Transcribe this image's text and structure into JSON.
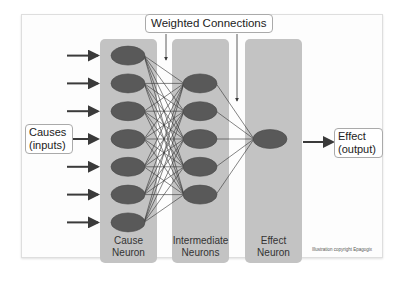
{
  "diagram": {
    "title_callout": "Weighted Connections",
    "inputs_label_line1": "Causes",
    "inputs_label_line2": "(inputs)",
    "output_label_line1": "Effect",
    "output_label_line2": "(output)",
    "columns": [
      {
        "label_line1": "Cause",
        "label_line2": "Neuron",
        "neuron_count": 7
      },
      {
        "label_line1": "Intermediate",
        "label_line2": "Neurons",
        "neuron_count": 5
      },
      {
        "label_line1": "Effect",
        "label_line2": "Neuron",
        "neuron_count": 1
      }
    ],
    "copyright": "Illustration copyright Epagogix",
    "colors": {
      "column_fill": "#c3c3c3",
      "neuron_fill": "#595959",
      "arrow": "#3a3a3a",
      "connection": "#333333"
    }
  }
}
